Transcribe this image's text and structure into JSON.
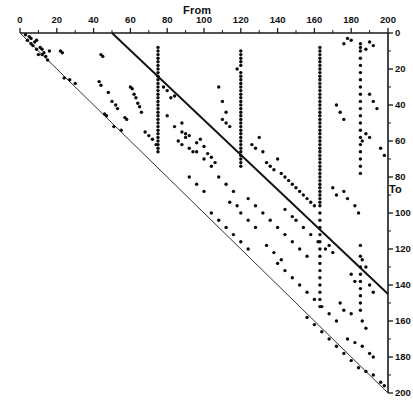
{
  "chart_data": {
    "type": "scatter",
    "title": "",
    "xlabel": "From",
    "ylabel": "To",
    "xlim": [
      0,
      200
    ],
    "ylim": [
      0,
      200
    ],
    "y_axis_position": "right",
    "y_axis_direction": "inverted",
    "x_axis_position": "top",
    "grid": false,
    "legend": null,
    "xticks": [
      0,
      20,
      40,
      60,
      80,
      100,
      120,
      140,
      160,
      180,
      200
    ],
    "xtick_labels": [
      "0",
      "20",
      "40",
      "60",
      "80",
      "100",
      "120",
      "140",
      "160",
      "180",
      "200"
    ],
    "yticks": [
      0,
      20,
      40,
      60,
      80,
      100,
      120,
      140,
      160,
      180,
      200
    ],
    "ytick_labels": [
      "0",
      "20",
      "40",
      "60",
      "80",
      "100",
      "120",
      "140",
      "160",
      "180",
      "200"
    ],
    "minor_tick_step": 10,
    "annotations": [
      {
        "name": "identity-line",
        "type": "line",
        "x": [
          50,
          200
        ],
        "y": [
          0,
          145
        ]
      },
      {
        "name": "lower-boundary-line",
        "type": "line",
        "x": [
          0,
          200
        ],
        "y": [
          0,
          200
        ]
      }
    ],
    "points": [
      [
        3,
        1
      ],
      [
        5,
        2
      ],
      [
        6,
        3
      ],
      [
        4,
        4
      ],
      [
        8,
        5
      ],
      [
        9,
        4
      ],
      [
        7,
        7
      ],
      [
        11,
        8
      ],
      [
        12,
        9
      ],
      [
        13,
        11
      ],
      [
        10,
        12
      ],
      [
        14,
        13
      ],
      [
        16,
        10
      ],
      [
        6,
        6
      ],
      [
        9,
        9
      ],
      [
        12,
        12
      ],
      [
        15,
        15
      ],
      [
        22,
        10
      ],
      [
        23,
        11
      ],
      [
        27,
        26
      ],
      [
        30,
        28
      ],
      [
        24,
        25
      ],
      [
        44,
        12
      ],
      [
        45,
        13
      ],
      [
        43,
        27
      ],
      [
        44,
        29
      ],
      [
        48,
        33
      ],
      [
        46,
        45
      ],
      [
        47,
        46
      ],
      [
        50,
        38
      ],
      [
        52,
        40
      ],
      [
        53,
        42
      ],
      [
        51,
        52
      ],
      [
        55,
        54
      ],
      [
        57,
        47
      ],
      [
        58,
        48
      ],
      [
        60,
        30
      ],
      [
        61,
        31
      ],
      [
        62,
        34
      ],
      [
        63,
        36
      ],
      [
        64,
        39
      ],
      [
        65,
        41
      ],
      [
        66,
        44
      ],
      [
        68,
        55
      ],
      [
        70,
        57
      ],
      [
        72,
        59
      ],
      [
        74,
        62
      ],
      [
        75,
        8
      ],
      [
        75,
        10
      ],
      [
        75,
        12
      ],
      [
        75,
        14
      ],
      [
        75,
        16
      ],
      [
        75,
        18
      ],
      [
        75,
        20
      ],
      [
        75,
        22
      ],
      [
        75,
        24
      ],
      [
        75,
        26
      ],
      [
        75,
        28
      ],
      [
        75,
        30
      ],
      [
        75,
        32
      ],
      [
        75,
        34
      ],
      [
        75,
        36
      ],
      [
        75,
        38
      ],
      [
        75,
        40
      ],
      [
        75,
        42
      ],
      [
        75,
        44
      ],
      [
        75,
        46
      ],
      [
        75,
        48
      ],
      [
        75,
        50
      ],
      [
        75,
        52
      ],
      [
        75,
        54
      ],
      [
        75,
        56
      ],
      [
        75,
        58
      ],
      [
        75,
        60
      ],
      [
        75,
        62
      ],
      [
        75,
        64
      ],
      [
        75,
        66
      ],
      [
        78,
        30
      ],
      [
        80,
        32
      ],
      [
        82,
        36
      ],
      [
        84,
        35
      ],
      [
        86,
        60
      ],
      [
        88,
        62
      ],
      [
        90,
        58
      ],
      [
        92,
        64
      ],
      [
        94,
        66
      ],
      [
        96,
        61
      ],
      [
        98,
        59
      ],
      [
        100,
        63
      ],
      [
        102,
        67
      ],
      [
        104,
        69
      ],
      [
        106,
        72
      ],
      [
        88,
        55
      ],
      [
        90,
        56
      ],
      [
        92,
        57
      ],
      [
        110,
        48
      ],
      [
        112,
        50
      ],
      [
        114,
        52
      ],
      [
        118,
        20
      ],
      [
        120,
        10
      ],
      [
        120,
        12
      ],
      [
        120,
        14
      ],
      [
        120,
        16
      ],
      [
        120,
        18
      ],
      [
        120,
        22
      ],
      [
        120,
        24
      ],
      [
        120,
        26
      ],
      [
        120,
        28
      ],
      [
        120,
        30
      ],
      [
        120,
        32
      ],
      [
        120,
        34
      ],
      [
        120,
        36
      ],
      [
        120,
        38
      ],
      [
        120,
        40
      ],
      [
        120,
        42
      ],
      [
        120,
        44
      ],
      [
        120,
        46
      ],
      [
        120,
        48
      ],
      [
        120,
        50
      ],
      [
        120,
        52
      ],
      [
        120,
        54
      ],
      [
        120,
        56
      ],
      [
        120,
        58
      ],
      [
        120,
        60
      ],
      [
        120,
        62
      ],
      [
        120,
        64
      ],
      [
        120,
        66
      ],
      [
        120,
        68
      ],
      [
        120,
        70
      ],
      [
        120,
        72
      ],
      [
        120,
        74
      ],
      [
        108,
        30
      ],
      [
        110,
        38
      ],
      [
        112,
        44
      ],
      [
        126,
        62
      ],
      [
        128,
        64
      ],
      [
        130,
        58
      ],
      [
        132,
        66
      ],
      [
        134,
        72
      ],
      [
        136,
        74
      ],
      [
        138,
        76
      ],
      [
        140,
        70
      ],
      [
        142,
        78
      ],
      [
        144,
        80
      ],
      [
        146,
        82
      ],
      [
        148,
        84
      ],
      [
        150,
        86
      ],
      [
        152,
        88
      ],
      [
        154,
        90
      ],
      [
        156,
        92
      ],
      [
        158,
        94
      ],
      [
        160,
        96
      ],
      [
        163,
        8
      ],
      [
        163,
        10
      ],
      [
        163,
        12
      ],
      [
        163,
        14
      ],
      [
        163,
        16
      ],
      [
        163,
        18
      ],
      [
        163,
        20
      ],
      [
        163,
        22
      ],
      [
        163,
        24
      ],
      [
        163,
        26
      ],
      [
        163,
        28
      ],
      [
        163,
        30
      ],
      [
        163,
        32
      ],
      [
        163,
        34
      ],
      [
        163,
        36
      ],
      [
        163,
        38
      ],
      [
        163,
        40
      ],
      [
        163,
        42
      ],
      [
        163,
        44
      ],
      [
        163,
        46
      ],
      [
        163,
        48
      ],
      [
        163,
        50
      ],
      [
        163,
        52
      ],
      [
        163,
        54
      ],
      [
        163,
        56
      ],
      [
        163,
        58
      ],
      [
        163,
        60
      ],
      [
        163,
        62
      ],
      [
        163,
        64
      ],
      [
        163,
        66
      ],
      [
        163,
        68
      ],
      [
        163,
        70
      ],
      [
        163,
        72
      ],
      [
        163,
        74
      ],
      [
        163,
        76
      ],
      [
        163,
        78
      ],
      [
        163,
        80
      ],
      [
        163,
        82
      ],
      [
        163,
        84
      ],
      [
        163,
        86
      ],
      [
        163,
        88
      ],
      [
        163,
        90
      ],
      [
        163,
        92
      ],
      [
        163,
        94
      ],
      [
        163,
        96
      ],
      [
        163,
        100
      ],
      [
        163,
        104
      ],
      [
        163,
        108
      ],
      [
        163,
        112
      ],
      [
        163,
        116
      ],
      [
        163,
        120
      ],
      [
        163,
        124
      ],
      [
        163,
        128
      ],
      [
        163,
        132
      ],
      [
        163,
        136
      ],
      [
        163,
        140
      ],
      [
        163,
        144
      ],
      [
        163,
        148
      ],
      [
        163,
        152
      ],
      [
        185,
        6
      ],
      [
        185,
        8
      ],
      [
        185,
        10
      ],
      [
        185,
        14
      ],
      [
        185,
        18
      ],
      [
        185,
        22
      ],
      [
        185,
        26
      ],
      [
        185,
        30
      ],
      [
        185,
        34
      ],
      [
        185,
        38
      ],
      [
        185,
        42
      ],
      [
        185,
        46
      ],
      [
        185,
        50
      ],
      [
        185,
        54
      ],
      [
        185,
        58
      ],
      [
        185,
        62
      ],
      [
        185,
        66
      ],
      [
        185,
        70
      ],
      [
        185,
        74
      ],
      [
        185,
        78
      ],
      [
        185,
        118
      ],
      [
        185,
        124
      ],
      [
        185,
        130
      ],
      [
        185,
        134
      ],
      [
        185,
        138
      ],
      [
        185,
        142
      ],
      [
        185,
        146
      ],
      [
        185,
        150
      ],
      [
        185,
        154
      ],
      [
        190,
        5
      ],
      [
        192,
        7
      ],
      [
        188,
        9
      ],
      [
        178,
        3
      ],
      [
        180,
        4
      ],
      [
        176,
        6
      ],
      [
        172,
        40
      ],
      [
        174,
        44
      ],
      [
        176,
        48
      ],
      [
        190,
        34
      ],
      [
        192,
        38
      ],
      [
        194,
        42
      ],
      [
        188,
        56
      ],
      [
        190,
        58
      ],
      [
        186,
        60
      ],
      [
        196,
        64
      ],
      [
        198,
        68
      ],
      [
        170,
        86
      ],
      [
        172,
        90
      ],
      [
        176,
        88
      ],
      [
        178,
        92
      ],
      [
        182,
        96
      ],
      [
        184,
        100
      ],
      [
        168,
        118
      ],
      [
        170,
        122
      ],
      [
        186,
        126
      ],
      [
        188,
        130
      ],
      [
        180,
        134
      ],
      [
        182,
        138
      ],
      [
        190,
        140
      ],
      [
        192,
        144
      ],
      [
        174,
        150
      ],
      [
        176,
        154
      ],
      [
        180,
        156
      ],
      [
        186,
        160
      ],
      [
        188,
        164
      ],
      [
        178,
        170
      ],
      [
        182,
        172
      ],
      [
        186,
        174
      ],
      [
        190,
        178
      ],
      [
        192,
        180
      ],
      [
        184,
        186
      ],
      [
        188,
        188
      ],
      [
        192,
        190
      ],
      [
        196,
        194
      ],
      [
        198,
        196
      ],
      [
        132,
        100
      ],
      [
        136,
        104
      ],
      [
        140,
        108
      ],
      [
        144,
        112
      ],
      [
        148,
        116
      ],
      [
        152,
        120
      ],
      [
        156,
        124
      ],
      [
        128,
        96
      ],
      [
        124,
        92
      ],
      [
        116,
        88
      ],
      [
        112,
        84
      ],
      [
        108,
        80
      ],
      [
        104,
        100
      ],
      [
        108,
        104
      ],
      [
        112,
        108
      ],
      [
        116,
        112
      ],
      [
        120,
        116
      ],
      [
        124,
        120
      ],
      [
        100,
        88
      ],
      [
        96,
        84
      ],
      [
        92,
        80
      ],
      [
        140,
        128
      ],
      [
        144,
        132
      ],
      [
        148,
        136
      ],
      [
        152,
        140
      ],
      [
        156,
        144
      ],
      [
        160,
        148
      ],
      [
        164,
        152
      ],
      [
        168,
        156
      ],
      [
        172,
        160
      ],
      [
        134,
        118
      ],
      [
        138,
        122
      ],
      [
        142,
        126
      ],
      [
        120,
        100
      ],
      [
        124,
        104
      ],
      [
        128,
        108
      ],
      [
        118,
        96
      ],
      [
        114,
        94
      ],
      [
        150,
        104
      ],
      [
        154,
        108
      ],
      [
        158,
        112
      ],
      [
        162,
        116
      ],
      [
        166,
        120
      ],
      [
        144,
        98
      ],
      [
        148,
        102
      ],
      [
        156,
        158
      ],
      [
        160,
        162
      ],
      [
        164,
        166
      ],
      [
        168,
        170
      ],
      [
        172,
        174
      ],
      [
        176,
        178
      ],
      [
        180,
        182
      ],
      [
        100,
        70
      ],
      [
        104,
        74
      ],
      [
        96,
        66
      ],
      [
        84,
        52
      ],
      [
        88,
        50
      ],
      [
        80,
        46
      ]
    ],
    "marker": {
      "shape": "circle",
      "color": "#0a0a0a",
      "size_px": 3.4
    }
  },
  "axes": {
    "from_label": "From",
    "to_label": "To"
  },
  "colors": {
    "axis": "#1a1a1a",
    "marker": "#0a0a0a",
    "identity_line": "#111111",
    "boundary_line": "#333333",
    "background": "#ffffff"
  }
}
